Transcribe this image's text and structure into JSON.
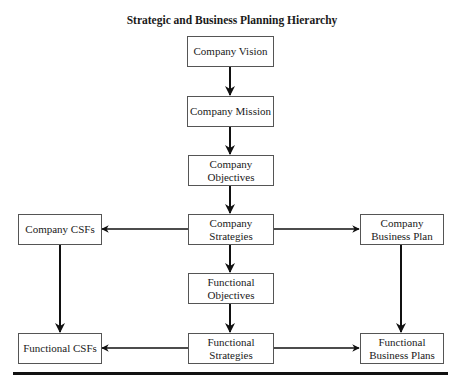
{
  "title": "Strategic and Business Planning Hierarchy",
  "nodes": {
    "company_vision": "Company Vision",
    "company_mission": "Company Mission",
    "company_objectives": "Company\nObjectives",
    "company_strategies": "Company\nStrategies",
    "company_csfs": "Company CSFs",
    "company_business_plan": "Company\nBusiness Plan",
    "functional_objectives": "Functional\nObjectives",
    "functional_strategies": "Functional\nStrategies",
    "functional_csfs": "Functional CSFs",
    "functional_business_plans": "Functional\nBusiness Plans"
  },
  "edges": [
    {
      "from": "company_vision",
      "to": "company_mission"
    },
    {
      "from": "company_mission",
      "to": "company_objectives"
    },
    {
      "from": "company_objectives",
      "to": "company_strategies"
    },
    {
      "from": "company_strategies",
      "to": "company_csfs"
    },
    {
      "from": "company_strategies",
      "to": "company_business_plan"
    },
    {
      "from": "company_strategies",
      "to": "functional_objectives"
    },
    {
      "from": "functional_objectives",
      "to": "functional_strategies"
    },
    {
      "from": "company_csfs",
      "to": "functional_csfs"
    },
    {
      "from": "company_business_plan",
      "to": "functional_business_plans"
    },
    {
      "from": "functional_strategies",
      "to": "functional_csfs"
    },
    {
      "from": "functional_strategies",
      "to": "functional_business_plans"
    }
  ]
}
